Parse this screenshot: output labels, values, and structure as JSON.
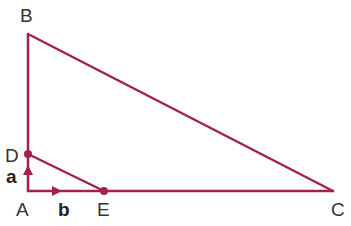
{
  "diagram": {
    "type": "geometry",
    "color": "#a3224c",
    "points": {
      "A": {
        "label": "A",
        "x": 28,
        "y": 191
      },
      "B": {
        "label": "B",
        "x": 28,
        "y": 34
      },
      "C": {
        "label": "C",
        "x": 333,
        "y": 191
      },
      "D": {
        "label": "D",
        "x": 28,
        "y": 154
      },
      "E": {
        "label": "E",
        "x": 104,
        "y": 191
      }
    },
    "segments": [
      [
        "A",
        "B"
      ],
      [
        "B",
        "C"
      ],
      [
        "A",
        "C"
      ],
      [
        "D",
        "E"
      ]
    ],
    "marked_points": [
      "D",
      "E"
    ],
    "vectors": [
      {
        "label": "a",
        "from": "A",
        "to": "D",
        "direction": "up"
      },
      {
        "label": "b",
        "from": "A",
        "to": "E",
        "direction": "right"
      }
    ]
  }
}
